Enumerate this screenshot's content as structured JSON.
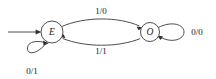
{
  "diagram": {
    "type": "finite-state-transducer",
    "background_color": "#ffffff",
    "stroke_color": "#3a3a3a",
    "text_color": "#1a1a1a",
    "states": [
      {
        "id": "E",
        "label": "E",
        "name": "even",
        "cx": 52,
        "cy": 32,
        "r": 11,
        "is_start": true
      },
      {
        "id": "O",
        "label": "O",
        "name": "odd",
        "cx": 150,
        "cy": 32,
        "r": 9.5,
        "is_start": false
      }
    ],
    "start_arrow": {
      "label": "",
      "from_x": 8,
      "to_x": 40,
      "y": 32
    },
    "transitions": [
      {
        "id": "e-to-o",
        "from": "E",
        "to": "O",
        "label": "1/0",
        "label_x": 101,
        "label_y": 11,
        "shape": "arc-top"
      },
      {
        "id": "o-to-e",
        "from": "O",
        "to": "E",
        "label": "1/1",
        "label_x": 101,
        "label_y": 51,
        "shape": "arc-bottom"
      },
      {
        "id": "e-self",
        "from": "E",
        "to": "E",
        "label": "0/1",
        "label_x": 32,
        "label_y": 71,
        "shape": "self-loop-down-left"
      },
      {
        "id": "o-self",
        "from": "O",
        "to": "O",
        "label": "0/0",
        "label_x": 197,
        "label_y": 32,
        "shape": "self-loop-right"
      }
    ]
  }
}
